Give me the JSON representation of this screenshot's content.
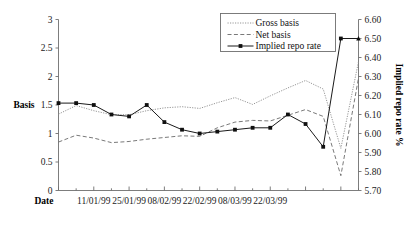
{
  "chart_data": {
    "type": "line",
    "title": "",
    "xlabel": "Date",
    "ylabel": "Basis",
    "y2label": "Implied repo rate %",
    "ylim": [
      0,
      3
    ],
    "y2lim": [
      5.7,
      6.6
    ],
    "yticks": [
      "0",
      "0.5",
      "1",
      "1.5",
      "2",
      "2.5",
      "3"
    ],
    "ytick_values": [
      0,
      0.5,
      1,
      1.5,
      2,
      2.5,
      3
    ],
    "y2ticks": [
      "5.70",
      "5.80",
      "5.90",
      "6.00",
      "6.10",
      "6.20",
      "6.30",
      "6.40",
      "6.50",
      "6.60"
    ],
    "y2tick_values": [
      5.7,
      5.8,
      5.9,
      6.0,
      6.1,
      6.2,
      6.3,
      6.4,
      6.5,
      6.6
    ],
    "grid": false,
    "legend_position": "top-right",
    "x_index": [
      0,
      1,
      2,
      3,
      4,
      5,
      6,
      7,
      8,
      9,
      10,
      11,
      12,
      13,
      14,
      15,
      16,
      17
    ],
    "xtick_labels": [
      "",
      "",
      "11/01/99",
      "",
      "25/01/99",
      "",
      "08/02/99",
      "",
      "22/02/99",
      "",
      "08/03/99",
      "",
      "22/03/99",
      "",
      "",
      "",
      "",
      ""
    ],
    "xtick_labels_shown": [
      "11/01/99",
      "25/01/99",
      "08/02/99",
      "22/02/99",
      "08/03/99",
      "22/03/99"
    ],
    "series": [
      {
        "name": "Gross basis",
        "axis": "left",
        "style": "dotted",
        "values": [
          1.34,
          1.49,
          1.4,
          1.33,
          1.33,
          1.4,
          1.45,
          1.47,
          1.44,
          1.54,
          1.63,
          1.51,
          1.66,
          1.8,
          1.93,
          1.78,
          0.74,
          2.26
        ]
      },
      {
        "name": "Net basis",
        "axis": "left",
        "style": "dashed",
        "values": [
          0.85,
          0.97,
          0.92,
          0.84,
          0.86,
          0.9,
          0.93,
          0.96,
          0.95,
          1.1,
          1.2,
          1.23,
          1.22,
          1.32,
          1.42,
          1.3,
          0.26,
          1.97
        ]
      },
      {
        "name": "Implied repo rate",
        "axis": "right",
        "style": "solid-markers",
        "values": [
          6.16,
          6.16,
          6.15,
          6.1,
          6.09,
          6.15,
          6.06,
          6.02,
          6.0,
          6.01,
          6.02,
          6.03,
          6.03,
          6.1,
          6.05,
          5.93,
          6.5,
          6.5
        ],
        "values_left_equiv": [
          1.55,
          1.55,
          1.49,
          1.35,
          1.32,
          1.49,
          1.2,
          1.09,
          1.0,
          1.04,
          1.1,
          1.1,
          1.1,
          1.41,
          1.18,
          0.74,
          2.65,
          2.65
        ]
      }
    ],
    "legend_entries": [
      "Gross basis",
      "Net basis",
      "Implied repo rate"
    ]
  }
}
